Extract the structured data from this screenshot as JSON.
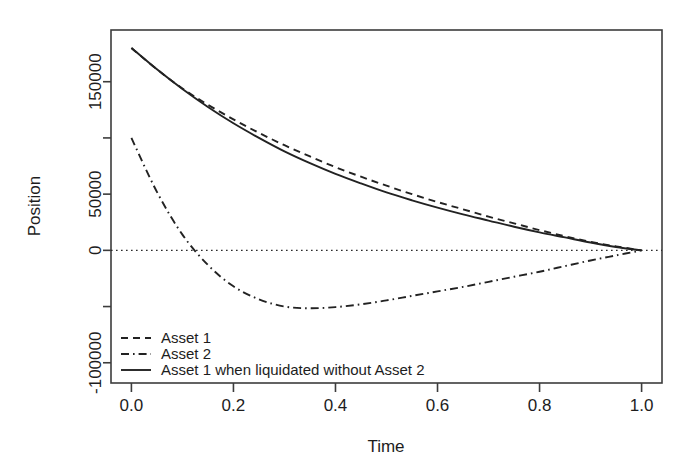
{
  "chart_data": {
    "type": "line",
    "title": "",
    "xlabel": "Time",
    "ylabel": "Position",
    "xlim": [
      -0.04,
      1.04
    ],
    "ylim": [
      -118000,
      196000
    ],
    "xticks": [
      0.0,
      0.2,
      0.4,
      0.6,
      0.8,
      1.0
    ],
    "xticklabels": [
      "0.0",
      "0.2",
      "0.4",
      "0.6",
      "0.8",
      "1.0"
    ],
    "yticks": [
      150000,
      100000,
      50000,
      0,
      -50000,
      -100000
    ],
    "yticklabels": [
      "150000",
      "",
      "50000",
      "0",
      "",
      "-100000"
    ],
    "grid": false,
    "zero_reference_line": 0,
    "legend_position": "bottom-left",
    "x": [
      0.0,
      0.05,
      0.1,
      0.15,
      0.2,
      0.25,
      0.3,
      0.35,
      0.4,
      0.45,
      0.5,
      0.55,
      0.6,
      0.65,
      0.7,
      0.75,
      0.8,
      0.85,
      0.9,
      0.95,
      1.0
    ],
    "series": [
      {
        "name": "Asset 1",
        "style": "dashed",
        "values": [
          180000,
          161000,
          144000,
          129500,
          116500,
          104500,
          93500,
          83500,
          74000,
          65500,
          57500,
          50000,
          43000,
          36500,
          30000,
          24000,
          18000,
          12500,
          7500,
          3500,
          0
        ]
      },
      {
        "name": "Asset 2",
        "style": "dashdot",
        "values": [
          100000,
          52000,
          14000,
          -13000,
          -32000,
          -43500,
          -50000,
          -51500,
          -50500,
          -48000,
          -44500,
          -40500,
          -36500,
          -32500,
          -28000,
          -23500,
          -19000,
          -14000,
          -9000,
          -4500,
          0
        ]
      },
      {
        "name": "Asset 1 when liquidated without Asset 2",
        "style": "solid",
        "values": [
          180000,
          161000,
          143500,
          127500,
          113000,
          100000,
          88000,
          77500,
          68000,
          59500,
          51500,
          44500,
          38000,
          32000,
          26500,
          21000,
          16000,
          11500,
          7000,
          3000,
          0
        ]
      }
    ]
  },
  "axis": {
    "y_label": "Position",
    "x_label": "Time"
  },
  "legend": {
    "items": [
      {
        "label": "Asset 1",
        "style": "dashed"
      },
      {
        "label": "Asset 2",
        "style": "dashdot"
      },
      {
        "label": "Asset 1 when liquidated without Asset 2",
        "style": "solid"
      }
    ]
  },
  "colors": {
    "ink": "#222222",
    "frame": "#3c3c3c",
    "background": "#ffffff"
  }
}
